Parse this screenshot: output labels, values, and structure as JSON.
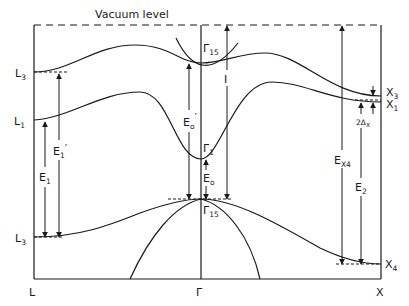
{
  "figure": {
    "title": "Vacuum level",
    "k_points": {
      "left": "L",
      "center": "Γ",
      "right": "X"
    },
    "left_levels": [
      {
        "main": "L",
        "sub": "3",
        "position": "upper conduction"
      },
      {
        "main": "L",
        "sub": "1",
        "position": "lower conduction"
      },
      {
        "main": "L",
        "sub": "3",
        "position": "valence"
      }
    ],
    "center_levels": [
      {
        "main": "Γ",
        "sub": "15",
        "position": "upper conduction"
      },
      {
        "main": "Γ",
        "sub": "1",
        "position": "conduction minimum"
      },
      {
        "main": "Γ",
        "sub": "15",
        "position": "valence maximum"
      }
    ],
    "right_levels": [
      {
        "main": "X",
        "sub": "3"
      },
      {
        "main": "X",
        "sub": "1"
      },
      {
        "main": "X",
        "sub": "4"
      }
    ],
    "transitions": [
      {
        "main": "E",
        "sub": "1",
        "prime": ""
      },
      {
        "main": "E",
        "sub": "1",
        "prime": "′"
      },
      {
        "main": "E",
        "sub": "o",
        "prime": "′"
      },
      {
        "main": "E",
        "sub": "o",
        "prime": ""
      },
      {
        "main": "I",
        "sub": "",
        "prime": ""
      },
      {
        "main": "E",
        "sub": "X4",
        "prime": ""
      },
      {
        "main": "2Δ",
        "sub": "X",
        "prime": ""
      },
      {
        "main": "E",
        "sub": "2",
        "prime": ""
      }
    ]
  }
}
